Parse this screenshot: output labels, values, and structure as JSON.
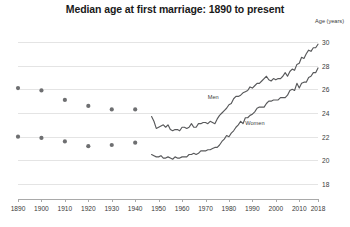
{
  "chart_data": {
    "type": "line",
    "title": "Median age at first marriage: 1890 to present",
    "xlabel": "",
    "ylabel": "Age (years)",
    "ylim": [
      17,
      31
    ],
    "xlim": [
      1890,
      2018
    ],
    "grid": true,
    "legend_position": "inline-annotation",
    "y_ticks": [
      30,
      28,
      26,
      24,
      22,
      20,
      18
    ],
    "x_ticks": [
      1890,
      1900,
      1910,
      1920,
      1930,
      1940,
      1950,
      1960,
      1970,
      1980,
      1990,
      2000,
      2010,
      2018
    ],
    "annotations": [
      {
        "text": "Men",
        "x": 1971,
        "y": 25.6
      },
      {
        "text": "Women",
        "x": 1987,
        "y": 23.4
      }
    ],
    "series": [
      {
        "name": "Men",
        "style": "markers",
        "x": [
          1890,
          1900,
          1910,
          1920,
          1930,
          1940
        ],
        "values": [
          26.1,
          25.9,
          25.1,
          24.6,
          24.3,
          24.3
        ]
      },
      {
        "name": "Women",
        "style": "markers",
        "x": [
          1890,
          1900,
          1910,
          1920,
          1930,
          1940
        ],
        "values": [
          22.0,
          21.9,
          21.6,
          21.2,
          21.3,
          21.5
        ]
      },
      {
        "name": "Men",
        "style": "line",
        "x": [
          1947,
          1948,
          1949,
          1950,
          1951,
          1952,
          1953,
          1954,
          1955,
          1956,
          1957,
          1958,
          1959,
          1960,
          1961,
          1962,
          1963,
          1964,
          1965,
          1966,
          1967,
          1968,
          1969,
          1970,
          1971,
          1972,
          1973,
          1974,
          1975,
          1976,
          1977,
          1978,
          1979,
          1980,
          1981,
          1982,
          1983,
          1984,
          1985,
          1986,
          1987,
          1988,
          1989,
          1990,
          1991,
          1992,
          1993,
          1994,
          1995,
          1996,
          1997,
          1998,
          1999,
          2000,
          2001,
          2002,
          2003,
          2004,
          2005,
          2006,
          2007,
          2008,
          2009,
          2010,
          2011,
          2012,
          2013,
          2014,
          2015,
          2016,
          2017,
          2018
        ],
        "values": [
          23.7,
          23.3,
          22.7,
          22.8,
          22.9,
          23.0,
          22.8,
          23.0,
          22.6,
          22.5,
          22.6,
          22.6,
          22.5,
          22.8,
          22.8,
          22.7,
          22.8,
          23.1,
          22.8,
          22.8,
          23.1,
          23.1,
          23.2,
          23.2,
          23.1,
          23.3,
          23.2,
          23.1,
          23.5,
          23.8,
          24.0,
          24.2,
          24.4,
          24.7,
          24.8,
          25.2,
          25.4,
          25.4,
          25.5,
          25.7,
          25.8,
          25.9,
          26.2,
          26.1,
          26.3,
          26.5,
          26.5,
          26.7,
          26.9,
          27.1,
          26.8,
          26.7,
          26.9,
          26.8,
          26.9,
          26.9,
          27.1,
          27.4,
          27.1,
          27.5,
          27.7,
          27.6,
          28.1,
          28.2,
          28.7,
          28.6,
          29.0,
          29.3,
          29.2,
          29.5,
          29.5,
          29.8
        ]
      },
      {
        "name": "Women",
        "style": "line",
        "x": [
          1947,
          1948,
          1949,
          1950,
          1951,
          1952,
          1953,
          1954,
          1955,
          1956,
          1957,
          1958,
          1959,
          1960,
          1961,
          1962,
          1963,
          1964,
          1965,
          1966,
          1967,
          1968,
          1969,
          1970,
          1971,
          1972,
          1973,
          1974,
          1975,
          1976,
          1977,
          1978,
          1979,
          1980,
          1981,
          1982,
          1983,
          1984,
          1985,
          1986,
          1987,
          1988,
          1989,
          1990,
          1991,
          1992,
          1993,
          1994,
          1995,
          1996,
          1997,
          1998,
          1999,
          2000,
          2001,
          2002,
          2003,
          2004,
          2005,
          2006,
          2007,
          2008,
          2009,
          2010,
          2011,
          2012,
          2013,
          2014,
          2015,
          2016,
          2017,
          2018
        ],
        "values": [
          20.5,
          20.4,
          20.3,
          20.3,
          20.4,
          20.2,
          20.2,
          20.3,
          20.2,
          20.1,
          20.3,
          20.2,
          20.2,
          20.3,
          20.3,
          20.3,
          20.5,
          20.5,
          20.6,
          20.5,
          20.6,
          20.8,
          20.8,
          20.8,
          20.9,
          20.9,
          21.0,
          21.1,
          21.1,
          21.3,
          21.6,
          21.8,
          22.1,
          22.0,
          22.3,
          22.5,
          22.8,
          23.0,
          23.3,
          23.1,
          23.6,
          23.6,
          23.8,
          23.9,
          24.1,
          24.4,
          24.5,
          24.5,
          24.5,
          24.8,
          25.0,
          25.0,
          25.1,
          25.1,
          25.1,
          25.3,
          25.3,
          25.3,
          25.5,
          25.9,
          26.0,
          25.9,
          26.5,
          26.1,
          26.5,
          26.6,
          26.6,
          27.0,
          27.1,
          27.4,
          27.4,
          27.8
        ]
      }
    ]
  }
}
